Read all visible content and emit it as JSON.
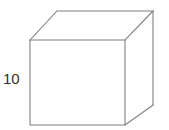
{
  "figure": {
    "kind": "cube-wireframe-diagram",
    "background_color": "#ffffff",
    "line_color": "#808080",
    "face_color": "#ffffff",
    "text_color": "#2e2e2e",
    "labels": {
      "height": "10"
    },
    "geometry": {
      "front_face": [
        [
          30,
          40
        ],
        [
          125,
          40
        ],
        [
          125,
          125
        ],
        [
          30,
          125
        ]
      ],
      "back_top_left": [
        57,
        11
      ],
      "back_top_right": [
        153,
        11
      ],
      "back_bottom_right": [
        153,
        105
      ]
    }
  }
}
